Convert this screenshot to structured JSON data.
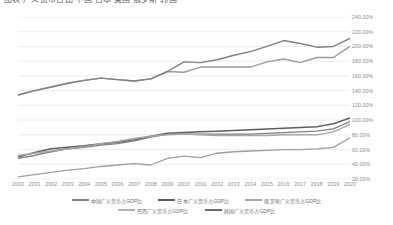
{
  "top_strip": {
    "clipped_text": "图表 广义货币占比 中国 日本 美国 俄罗斯 韩国"
  },
  "chart_data": {
    "type": "line",
    "title": "",
    "xlabel": "",
    "ylabel": "",
    "ylim": [
      20,
      240
    ],
    "ytick_format": "percent",
    "grid": true,
    "legend_position": "bottom",
    "x": [
      2000,
      2001,
      2002,
      2003,
      2004,
      2005,
      2006,
      2007,
      2008,
      2009,
      2010,
      2011,
      2012,
      2013,
      2014,
      2015,
      2016,
      2017,
      2018,
      2019,
      2020
    ],
    "ytick_labels": [
      "240.00%",
      "220.00%",
      "200.00%",
      "180.00%",
      "160.00%",
      "140.00%",
      "120.00%",
      "100.00%",
      "80.00%",
      "60.00%",
      "40.00%",
      "20.00%"
    ],
    "ytick_values": [
      240,
      220,
      200,
      180,
      160,
      140,
      120,
      100,
      80,
      60,
      40,
      20
    ],
    "xtick_labels": [
      "2000",
      "2001",
      "2002",
      "2003",
      "2004",
      "2005",
      "2006",
      "2007",
      "2008",
      "2009",
      "2010",
      "2011",
      "2012",
      "2013",
      "2014",
      "2015",
      "2016",
      "2017",
      "2018",
      "2019",
      "2020"
    ],
    "series": [
      {
        "name": "日本广义货币占GDP比",
        "color": "#9a9a9a",
        "width": 1.4,
        "values": [
          134,
          140,
          145,
          150,
          154,
          157,
          155,
          153,
          156,
          166,
          165,
          172,
          172,
          172,
          172,
          179,
          183,
          178,
          185,
          185,
          200
        ]
      },
      {
        "name": "中国广义货币占GDP比",
        "color": "#808080",
        "width": 1.4,
        "values": [
          134,
          140,
          145,
          150,
          154,
          157,
          155,
          153,
          156,
          166,
          179,
          178,
          182,
          188,
          193,
          200,
          208,
          204,
          199,
          200,
          211
        ]
      },
      {
        "name": "韩国广义货币占GDP比",
        "color": "#5d5d5d",
        "width": 1.5,
        "values": [
          50,
          56,
          61,
          63,
          65,
          68,
          70,
          73,
          78,
          82,
          83,
          84,
          85,
          86,
          87,
          88,
          89,
          90,
          91,
          95,
          103
        ]
      },
      {
        "name": "美国广义货币占GDP比",
        "color": "#7e7e7e",
        "width": 1.4,
        "values": [
          48,
          52,
          57,
          61,
          63,
          66,
          68,
          72,
          77,
          81,
          81,
          81,
          81,
          81,
          81,
          82,
          83,
          84,
          85,
          88,
          98
        ]
      },
      {
        "name": "俄罗斯广义货币占GDP比",
        "color": "#a5a5a5",
        "width": 1.4,
        "values": [
          52,
          55,
          58,
          61,
          64,
          68,
          71,
          75,
          78,
          80,
          81,
          80,
          79,
          79,
          79,
          79,
          80,
          80,
          80,
          84,
          94
        ]
      },
      {
        "name": "底部对照线",
        "color": "#9e9e9e",
        "width": 1.3,
        "values": [
          23,
          26,
          29,
          32,
          34,
          37,
          39,
          41,
          39,
          48,
          51,
          49,
          55,
          57,
          58,
          59,
          60,
          60,
          61,
          63,
          76
        ]
      }
    ],
    "legend": [
      {
        "label": "中国广义货币占GDP比",
        "color": "#808080"
      },
      {
        "label": "日本广义货币占GDP比",
        "color": "#5d5d5d"
      },
      {
        "label": "俄罗斯广义货币占GDP比",
        "color": "#a5a5a5"
      },
      {
        "label": "巴西广义货币占GDP比",
        "color": "#b0b0b0"
      },
      {
        "label": "韩国广义货币占GDP比",
        "color": "#6a6a6a"
      }
    ]
  },
  "style": {
    "grid_color": "#ededed",
    "tick_color": "#8a8a8a",
    "background": "#ffffff"
  }
}
